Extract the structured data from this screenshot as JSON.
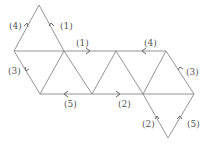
{
  "diagram": {
    "labels": [
      {
        "id": "top-left",
        "text": "(4)"
      },
      {
        "id": "top-right",
        "text": "(1)"
      },
      {
        "id": "mid-top-1",
        "text": "(1)"
      },
      {
        "id": "mid-top-4",
        "text": "(4)"
      },
      {
        "id": "left",
        "text": "(3)"
      },
      {
        "id": "right",
        "text": "(3)"
      },
      {
        "id": "bottom-5",
        "text": "(5)"
      },
      {
        "id": "bottom-2",
        "text": "(2)"
      },
      {
        "id": "lower-left",
        "text": "(2)"
      },
      {
        "id": "lower-right",
        "text": "(5)"
      }
    ]
  }
}
